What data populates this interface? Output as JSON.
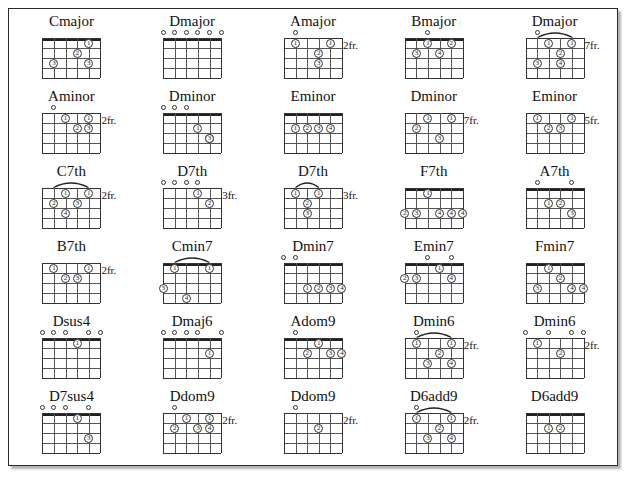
{
  "page": {
    "columns": 5,
    "rows": 6,
    "strings": 6,
    "frets": 4,
    "colors": {
      "ink": "#222222",
      "paper": "#ffffff",
      "border": "#2b2b2b"
    }
  },
  "chords": [
    {
      "name": "Cmajor",
      "fret_label": "",
      "nut": true,
      "barre": null,
      "opens": [],
      "dots": [
        {
          "s": 2,
          "f": 3,
          "finger": "3"
        },
        {
          "s": 4,
          "f": 2,
          "finger": "2"
        },
        {
          "s": 5,
          "f": 1,
          "finger": "1"
        },
        {
          "s": 5,
          "f": 3,
          "finger": "3"
        }
      ]
    },
    {
      "name": "Dmajor",
      "fret_label": "",
      "nut": true,
      "barre": null,
      "opens": [
        1,
        2,
        3,
        4,
        5,
        6
      ],
      "dots": []
    },
    {
      "name": "Amajor",
      "fret_label": "2fr.",
      "nut": false,
      "barre": null,
      "opens": [
        2
      ],
      "dots": [
        {
          "s": 2,
          "f": 1,
          "finger": "1"
        },
        {
          "s": 5,
          "f": 1,
          "finger": "1"
        },
        {
          "s": 4,
          "f": 2,
          "finger": "2"
        },
        {
          "s": 4,
          "f": 3,
          "finger": "3"
        }
      ]
    },
    {
      "name": "Bmajor",
      "fret_label": "",
      "nut": true,
      "barre": null,
      "opens": [
        3
      ],
      "dots": [
        {
          "s": 3,
          "f": 1,
          "finger": "1"
        },
        {
          "s": 5,
          "f": 1,
          "finger": "2"
        },
        {
          "s": 2,
          "f": 2,
          "finger": "3"
        },
        {
          "s": 4,
          "f": 2,
          "finger": "4"
        }
      ]
    },
    {
      "name": "Dmajor",
      "fret_label": "7fr.",
      "nut": false,
      "barre": {
        "from": 2,
        "to": 5
      },
      "opens": [
        2
      ],
      "dots": [
        {
          "s": 3,
          "f": 1,
          "finger": "1"
        },
        {
          "s": 5,
          "f": 1,
          "finger": "1"
        },
        {
          "s": 4,
          "f": 2,
          "finger": "2"
        },
        {
          "s": 2,
          "f": 3,
          "finger": "3"
        },
        {
          "s": 4,
          "f": 3,
          "finger": "4"
        }
      ]
    },
    {
      "name": "Aminor",
      "fret_label": "2fr.",
      "nut": false,
      "barre": null,
      "opens": [
        2
      ],
      "dots": [
        {
          "s": 3,
          "f": 1,
          "finger": "1"
        },
        {
          "s": 5,
          "f": 1,
          "finger": "1"
        },
        {
          "s": 4,
          "f": 2,
          "finger": "2"
        },
        {
          "s": 5,
          "f": 2,
          "finger": "3"
        }
      ]
    },
    {
      "name": "Dminor",
      "fret_label": "",
      "nut": true,
      "barre": null,
      "opens": [
        1,
        2,
        3
      ],
      "dots": [
        {
          "s": 4,
          "f": 2,
          "finger": "1"
        },
        {
          "s": 5,
          "f": 3,
          "finger": "2"
        },
        {
          "s": 5,
          "f": 3,
          "finger": "3"
        }
      ]
    },
    {
      "name": "Eminor",
      "fret_label": "",
      "nut": true,
      "barre": null,
      "opens": [],
      "dots": [
        {
          "s": 2,
          "f": 2,
          "finger": "1"
        },
        {
          "s": 3,
          "f": 2,
          "finger": "2"
        },
        {
          "s": 4,
          "f": 2,
          "finger": "3"
        },
        {
          "s": 5,
          "f": 2,
          "finger": "4"
        }
      ]
    },
    {
      "name": "Dminor",
      "fret_label": "7fr.",
      "nut": false,
      "barre": null,
      "opens": [],
      "dots": [
        {
          "s": 3,
          "f": 1,
          "finger": "1"
        },
        {
          "s": 5,
          "f": 1,
          "finger": "1"
        },
        {
          "s": 2,
          "f": 2,
          "finger": "2"
        },
        {
          "s": 4,
          "f": 3,
          "finger": "3"
        }
      ]
    },
    {
      "name": "Eminor",
      "fret_label": "5fr.",
      "nut": false,
      "barre": null,
      "opens": [],
      "dots": [
        {
          "s": 2,
          "f": 1,
          "finger": "1"
        },
        {
          "s": 5,
          "f": 1,
          "finger": "1"
        },
        {
          "s": 3,
          "f": 2,
          "finger": "2"
        },
        {
          "s": 4,
          "f": 2,
          "finger": "3"
        }
      ]
    },
    {
      "name": "C7th",
      "fret_label": "2fr.",
      "nut": false,
      "barre": {
        "from": 2,
        "to": 5
      },
      "opens": [],
      "dots": [
        {
          "s": 3,
          "f": 1,
          "finger": "1"
        },
        {
          "s": 5,
          "f": 1,
          "finger": "1"
        },
        {
          "s": 2,
          "f": 2,
          "finger": "2"
        },
        {
          "s": 4,
          "f": 2,
          "finger": "3"
        },
        {
          "s": 3,
          "f": 3,
          "finger": "4"
        }
      ]
    },
    {
      "name": "D7th",
      "fret_label": "3fr.",
      "nut": false,
      "barre": null,
      "opens": [
        1,
        2,
        3,
        4
      ],
      "dots": [
        {
          "s": 4,
          "f": 1,
          "finger": "1"
        },
        {
          "s": 5,
          "f": 2,
          "finger": "2"
        }
      ]
    },
    {
      "name": "D7th",
      "fret_label": "3fr.",
      "nut": false,
      "barre": {
        "from": 2,
        "to": 4
      },
      "opens": [],
      "dots": [
        {
          "s": 2,
          "f": 1,
          "finger": "1"
        },
        {
          "s": 4,
          "f": 1,
          "finger": "1"
        },
        {
          "s": 3,
          "f": 2,
          "finger": "2"
        },
        {
          "s": 3,
          "f": 3,
          "finger": "3"
        }
      ]
    },
    {
      "name": "F7th",
      "fret_label": "",
      "nut": true,
      "barre": null,
      "opens": [],
      "dots": [
        {
          "s": 3,
          "f": 1,
          "finger": "1"
        },
        {
          "s": 1,
          "f": 3,
          "finger": "2"
        },
        {
          "s": 2,
          "f": 3,
          "finger": "3"
        },
        {
          "s": 4,
          "f": 3,
          "finger": "4"
        },
        {
          "s": 5,
          "f": 3,
          "finger": "4"
        },
        {
          "s": 6,
          "f": 3,
          "finger": "4"
        }
      ]
    },
    {
      "name": "A7th",
      "fret_label": "",
      "nut": true,
      "barre": null,
      "opens": [
        2,
        5
      ],
      "dots": [
        {
          "s": 3,
          "f": 2,
          "finger": "1"
        },
        {
          "s": 4,
          "f": 2,
          "finger": "2"
        },
        {
          "s": 5,
          "f": 3,
          "finger": "3"
        }
      ]
    },
    {
      "name": "B7th",
      "fret_label": "2fr.",
      "nut": false,
      "barre": null,
      "opens": [],
      "dots": [
        {
          "s": 2,
          "f": 1,
          "finger": "1"
        },
        {
          "s": 5,
          "f": 1,
          "finger": "1"
        },
        {
          "s": 3,
          "f": 2,
          "finger": "2"
        },
        {
          "s": 4,
          "f": 2,
          "finger": "3"
        }
      ]
    },
    {
      "name": "Cmin7",
      "fret_label": "",
      "nut": true,
      "barre": {
        "from": 2,
        "to": 5
      },
      "opens": [],
      "dots": [
        {
          "s": 2,
          "f": 1,
          "finger": "1"
        },
        {
          "s": 5,
          "f": 1,
          "finger": "1"
        },
        {
          "s": 1,
          "f": 3,
          "finger": "3"
        },
        {
          "s": 3,
          "f": 4,
          "finger": "4"
        }
      ]
    },
    {
      "name": "Dmin7",
      "fret_label": "",
      "nut": true,
      "barre": null,
      "opens": [
        1,
        2
      ],
      "dots": [
        {
          "s": 3,
          "f": 3,
          "finger": "1"
        },
        {
          "s": 4,
          "f": 3,
          "finger": "2"
        },
        {
          "s": 5,
          "f": 3,
          "finger": "3"
        },
        {
          "s": 6,
          "f": 3,
          "finger": "4"
        }
      ]
    },
    {
      "name": "Emin7",
      "fret_label": "",
      "nut": true,
      "barre": null,
      "opens": [
        3,
        5
      ],
      "dots": [
        {
          "s": 4,
          "f": 1,
          "finger": "1"
        },
        {
          "s": 1,
          "f": 2,
          "finger": "2"
        },
        {
          "s": 2,
          "f": 2,
          "finger": "3"
        },
        {
          "s": 5,
          "f": 2,
          "finger": "4"
        }
      ]
    },
    {
      "name": "Fmin7",
      "fret_label": "",
      "nut": true,
      "barre": null,
      "opens": [],
      "dots": [
        {
          "s": 3,
          "f": 1,
          "finger": "1"
        },
        {
          "s": 4,
          "f": 2,
          "finger": "2"
        },
        {
          "s": 2,
          "f": 3,
          "finger": "3"
        },
        {
          "s": 5,
          "f": 3,
          "finger": "4"
        },
        {
          "s": 6,
          "f": 3,
          "finger": "4"
        }
      ]
    },
    {
      "name": "Dsus4",
      "fret_label": "",
      "nut": true,
      "barre": null,
      "opens": [
        1,
        2,
        3,
        5,
        6
      ],
      "dots": [
        {
          "s": 4,
          "f": 1,
          "finger": "1"
        }
      ]
    },
    {
      "name": "Dmaj6",
      "fret_label": "",
      "nut": true,
      "barre": null,
      "opens": [
        1,
        2,
        3,
        4,
        6
      ],
      "dots": [
        {
          "s": 5,
          "f": 2,
          "finger": "1"
        }
      ]
    },
    {
      "name": "Adom9",
      "fret_label": "",
      "nut": true,
      "barre": null,
      "opens": [
        2
      ],
      "dots": [
        {
          "s": 4,
          "f": 1,
          "finger": "1"
        },
        {
          "s": 3,
          "f": 2,
          "finger": "2"
        },
        {
          "s": 5,
          "f": 2,
          "finger": "3"
        },
        {
          "s": 6,
          "f": 2,
          "finger": "4"
        }
      ]
    },
    {
      "name": "Dmin6",
      "fret_label": "2fr.",
      "nut": false,
      "barre": {
        "from": 2,
        "to": 5
      },
      "opens": [
        2
      ],
      "dots": [
        {
          "s": 2,
          "f": 1,
          "finger": "1"
        },
        {
          "s": 5,
          "f": 1,
          "finger": "1"
        },
        {
          "s": 4,
          "f": 2,
          "finger": "2"
        },
        {
          "s": 3,
          "f": 3,
          "finger": "3"
        },
        {
          "s": 5,
          "f": 3,
          "finger": "4"
        }
      ]
    },
    {
      "name": "Dmin6",
      "fret_label": "2fr.",
      "nut": false,
      "barre": null,
      "opens": [
        1,
        3,
        5,
        6
      ],
      "dots": [
        {
          "s": 2,
          "f": 1,
          "finger": "1"
        },
        {
          "s": 4,
          "f": 2,
          "finger": "2"
        }
      ]
    },
    {
      "name": "D7sus4",
      "fret_label": "",
      "nut": true,
      "barre": null,
      "opens": [
        1,
        2,
        3,
        5
      ],
      "dots": [
        {
          "s": 4,
          "f": 1,
          "finger": "1"
        },
        {
          "s": 5,
          "f": 3,
          "finger": "3"
        }
      ]
    },
    {
      "name": "Ddom9",
      "fret_label": "2fr.",
      "nut": false,
      "barre": null,
      "opens": [
        2
      ],
      "dots": [
        {
          "s": 3,
          "f": 1,
          "finger": "1"
        },
        {
          "s": 5,
          "f": 1,
          "finger": "1"
        },
        {
          "s": 2,
          "f": 2,
          "finger": "2"
        },
        {
          "s": 4,
          "f": 2,
          "finger": "3"
        },
        {
          "s": 5,
          "f": 2,
          "finger": "4"
        }
      ]
    },
    {
      "name": "Ddom9",
      "fret_label": "2fr.",
      "nut": false,
      "barre": null,
      "opens": [
        2
      ],
      "dots": [
        {
          "s": 4,
          "f": 2,
          "finger": "2"
        }
      ]
    },
    {
      "name": "D6add9",
      "fret_label": "2fr.",
      "nut": false,
      "barre": {
        "from": 2,
        "to": 5
      },
      "opens": [
        2
      ],
      "dots": [
        {
          "s": 2,
          "f": 1,
          "finger": "1"
        },
        {
          "s": 5,
          "f": 1,
          "finger": "1"
        },
        {
          "s": 4,
          "f": 2,
          "finger": "2"
        },
        {
          "s": 3,
          "f": 3,
          "finger": "3"
        },
        {
          "s": 5,
          "f": 3,
          "finger": "4"
        }
      ]
    },
    {
      "name": "D6add9",
      "fret_label": "",
      "nut": true,
      "barre": null,
      "opens": [],
      "dots": [
        {
          "s": 3,
          "f": 2,
          "finger": "1"
        },
        {
          "s": 4,
          "f": 2,
          "finger": "2"
        }
      ]
    }
  ]
}
